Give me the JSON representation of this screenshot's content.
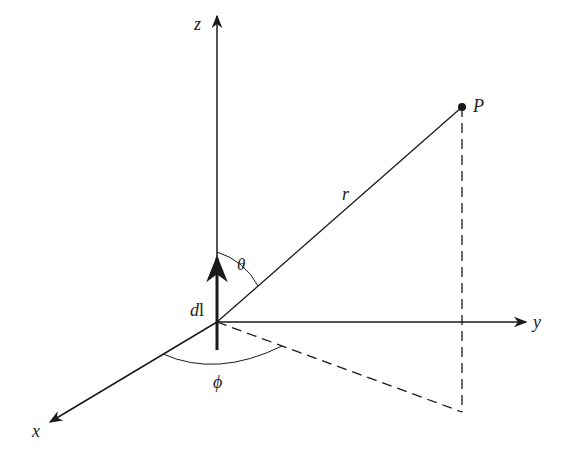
{
  "diagram": {
    "axes": {
      "z": {
        "label": "z"
      },
      "y": {
        "label": "y"
      },
      "x": {
        "label": "x"
      }
    },
    "element": {
      "label_d": "d",
      "label_l": "l"
    },
    "point": {
      "label": "P"
    },
    "radius": {
      "label": "r"
    },
    "angles": {
      "theta": {
        "label": "θ"
      },
      "phi": {
        "label": "ϕ"
      }
    },
    "colors": {
      "stroke": "#1a1a1a",
      "background": "#ffffff"
    }
  }
}
